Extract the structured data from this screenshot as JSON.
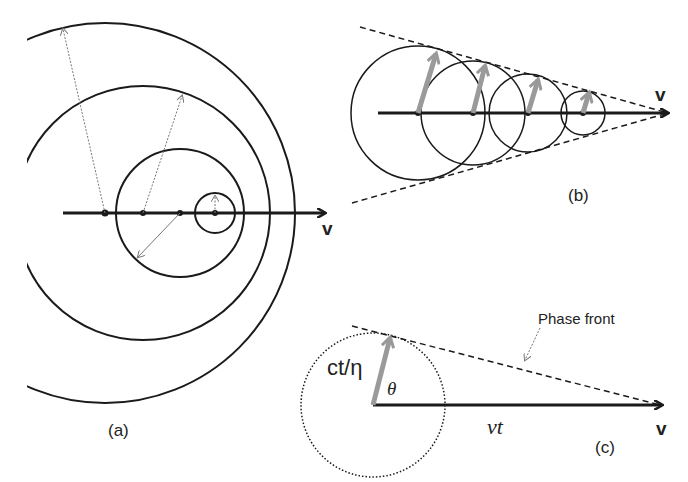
{
  "panels": {
    "a": {
      "caption": "(a)",
      "velocity_label": "v",
      "description": "Subluminal moving source: nested non-overlapping wave circles emitted at successive positions"
    },
    "b": {
      "caption": "(b)",
      "velocity_label": "v",
      "description": "Superluminal source: overlapping circles bounded by a conical (Mach/Cherenkov) envelope"
    },
    "c": {
      "caption": "(c)",
      "velocity_label": "v",
      "radius_label": "ct/η",
      "angle_label": "θ",
      "distance_label": "vt",
      "annotation": "Phase front"
    }
  },
  "colors": {
    "line": "#1a1a1a",
    "arrow_gray": "#8a8a8a",
    "background": "#ffffff"
  }
}
